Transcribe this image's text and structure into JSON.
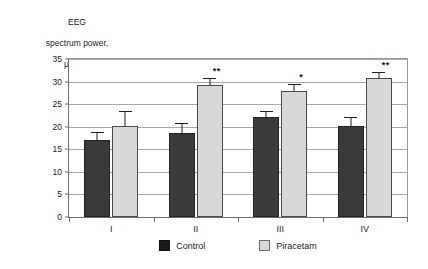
{
  "chart_data": {
    "type": "bar",
    "title": "",
    "ylabel_lines": [
      "EEG",
      "spectrum power,",
      "μV²/Hz"
    ],
    "ylabel": "EEG spectrum power, μV²/Hz",
    "xlabel": "",
    "categories": [
      "I",
      "II",
      "III",
      "IV"
    ],
    "ylim": [
      0,
      35
    ],
    "yticks": [
      0,
      5,
      10,
      15,
      20,
      25,
      30,
      35
    ],
    "grid": true,
    "legend_position": "bottom",
    "series": [
      {
        "name": "Control",
        "color": "#3a3a3a",
        "values": [
          17.0,
          18.7,
          22.1,
          20.1
        ],
        "errors": [
          1.8,
          2.1,
          1.3,
          2.0
        ],
        "significance": [
          "",
          "",
          "",
          ""
        ]
      },
      {
        "name": "Piracetam",
        "color": "#d8d8d8",
        "values": [
          20.2,
          29.3,
          28.0,
          30.8
        ],
        "errors": [
          3.3,
          1.5,
          1.5,
          1.3
        ],
        "significance": [
          "",
          "**",
          "*",
          "**"
        ]
      }
    ]
  },
  "legend": {
    "items": [
      {
        "label": "Control",
        "swatch": "control"
      },
      {
        "label": "Piracetam",
        "swatch": "drug"
      }
    ]
  }
}
